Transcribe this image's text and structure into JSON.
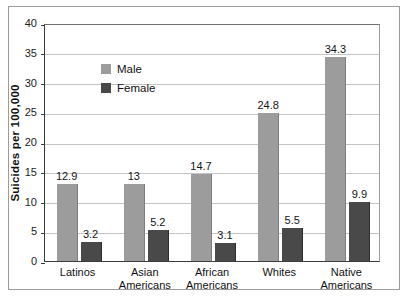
{
  "chart_data": {
    "type": "bar",
    "title": "",
    "subtitle": "",
    "xlabel": "",
    "ylabel": "Suicides per 100,000",
    "ylim": [
      0,
      40
    ],
    "ytick_labels": [
      "40",
      "35",
      "30",
      "25",
      "20",
      "15",
      "10",
      "5",
      "0"
    ],
    "ytick_values": [
      40,
      35,
      30,
      25,
      20,
      15,
      10,
      5,
      0
    ],
    "grid": "horizontal",
    "legend_position": "inside-top-left",
    "categories": [
      "Latinos",
      "Asian\nAmericans",
      "African\nAmericans",
      "Whites",
      "Native\nAmericans"
    ],
    "category_lines": [
      [
        "Latinos"
      ],
      [
        "Asian",
        "Americans"
      ],
      [
        "African",
        "Americans"
      ],
      [
        "Whites"
      ],
      [
        "Native",
        "Americans"
      ]
    ],
    "series": [
      {
        "name": "Male",
        "color": "#9c9c9c",
        "values": [
          12.9,
          13,
          14.7,
          24.8,
          34.3
        ],
        "labels": [
          "12.9",
          "13",
          "14.7",
          "24.8",
          "34.3"
        ]
      },
      {
        "name": "Female",
        "color": "#494949",
        "values": [
          3.2,
          5.2,
          3.1,
          5.5,
          9.9
        ],
        "labels": [
          "3.2",
          "5.2",
          "3.1",
          "5.5",
          "9.9"
        ]
      }
    ],
    "annotations": []
  },
  "legend": {
    "items": [
      {
        "label": "Male",
        "swatch": "male"
      },
      {
        "label": "Female",
        "swatch": "female"
      }
    ]
  }
}
